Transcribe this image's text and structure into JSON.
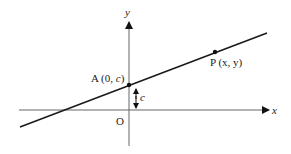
{
  "diagram": {
    "type": "coordinate-geometry",
    "axes": {
      "x_label": "x",
      "y_label": "y",
      "origin_label": "O"
    },
    "points": {
      "A": {
        "label": "A (0, ",
        "coord_italic": "c",
        "close": ")"
      },
      "P": {
        "label": "P (x, y)"
      }
    },
    "intercept_label": "c",
    "colors": {
      "line": "#1a1a1a",
      "axis": "#555555",
      "text": "#222222"
    }
  }
}
